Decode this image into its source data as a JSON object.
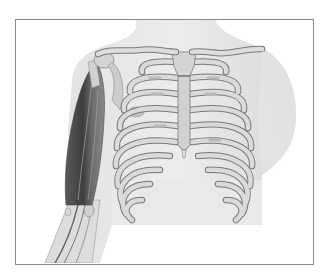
{
  "image": {
    "subject": "anatomical illustration of human thoracic skeleton with arm",
    "elements": [
      "rib-cage",
      "sternum",
      "clavicles",
      "upper-arm-muscle",
      "forearm",
      "body-silhouette"
    ],
    "colors": {
      "background": "#ffffff",
      "frame_border": "#8a8a8a",
      "skin": "#e4e4e4",
      "bone": "#d6d6d6",
      "bone_outline": "#7a7a7a",
      "muscle_dark": "#4a4a4a",
      "muscle_mid": "#777777"
    }
  }
}
